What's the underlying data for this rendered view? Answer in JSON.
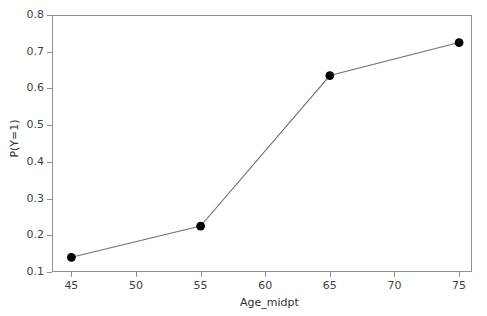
{
  "chart_data": {
    "type": "line",
    "title": "",
    "subtitle": "",
    "xlabel": "Age_midpt",
    "ylabel": "P(Y=1)",
    "x": [
      45,
      55,
      65,
      75
    ],
    "values": [
      0.14,
      0.225,
      0.635,
      0.725
    ],
    "series": [
      {
        "name": "P(Y=1)",
        "x": [
          45,
          55,
          65,
          75
        ],
        "values": [
          0.14,
          0.225,
          0.635,
          0.725
        ]
      }
    ],
    "xlim": [
      43.5,
      76.0
    ],
    "ylim": [
      0.1,
      0.8
    ],
    "xticks": [
      45,
      50,
      55,
      60,
      65,
      70,
      75
    ],
    "yticks": [
      0.1,
      0.2,
      0.3,
      0.4,
      0.5,
      0.6,
      0.7,
      0.8
    ],
    "xtick_labels": [
      "45",
      "50",
      "55",
      "60",
      "65",
      "70",
      "75"
    ],
    "ytick_labels": [
      "0.1",
      "0.2",
      "0.3",
      "0.4",
      "0.5",
      "0.6",
      "0.7",
      "0.8"
    ],
    "grid": false,
    "legend": false,
    "legend_position": "none",
    "marker": "filled-circle",
    "marker_color": "#000000",
    "line_color": "#6f7276",
    "frame_color": "#8d8f92",
    "background_color": "#ffffff",
    "text_color": "#3f3f3f"
  }
}
